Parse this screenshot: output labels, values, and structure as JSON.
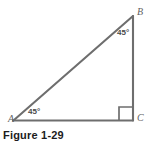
{
  "figure": {
    "caption": "Figure 1-29",
    "background_color": "#ffffff",
    "stroke_color": "#6e6e6e",
    "label_color": "#5f5f5f",
    "caption_color": "#1c1c1c",
    "stroke_width": 2,
    "canvas": {
      "width": 151,
      "height": 148
    }
  },
  "diagram": {
    "type": "right-triangle",
    "vertices": [
      {
        "id": "A",
        "label": "A",
        "x": 14,
        "y": 120,
        "position": "bottom-left"
      },
      {
        "id": "B",
        "label": "B",
        "x": 133,
        "y": 16,
        "position": "top-right"
      },
      {
        "id": "C",
        "label": "C",
        "x": 133,
        "y": 120,
        "position": "bottom-right"
      }
    ],
    "sides": [
      {
        "id": "AB",
        "from": "A",
        "to": "B",
        "role": "hypotenuse"
      },
      {
        "id": "BC",
        "from": "B",
        "to": "C",
        "role": "vertical-leg"
      },
      {
        "id": "AC",
        "from": "A",
        "to": "C",
        "role": "horizontal-leg"
      }
    ],
    "angles": [
      {
        "at": "A",
        "label": "45°",
        "value": 45,
        "marker": "none"
      },
      {
        "at": "B",
        "label": "45°",
        "value": 45,
        "marker": "none"
      },
      {
        "at": "C",
        "label": "",
        "value": 90,
        "marker": "right-angle-square"
      }
    ],
    "right_angle_marker": {
      "at": "C",
      "x": 118,
      "y": 105,
      "size": 12
    }
  }
}
